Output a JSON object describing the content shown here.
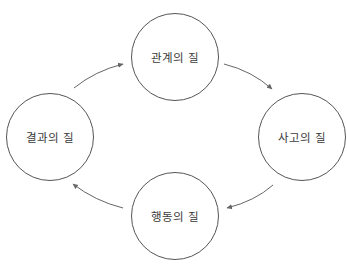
{
  "diagram": {
    "type": "cycle",
    "direction": "clockwise",
    "colors": {
      "stroke": "#555555",
      "arrow": "#666666",
      "text": "#3a3a3a",
      "background": "#ffffff"
    },
    "nodes": [
      {
        "id": "top",
        "label": "관계의 질",
        "cx": 175,
        "cy": 57,
        "r": 44
      },
      {
        "id": "right",
        "label": "사고의 질",
        "cx": 302,
        "cy": 137,
        "r": 44
      },
      {
        "id": "bottom",
        "label": "행동의 질",
        "cx": 175,
        "cy": 216,
        "r": 44
      },
      {
        "id": "left",
        "label": "결과의 질",
        "cx": 50,
        "cy": 137,
        "r": 44
      }
    ],
    "edges": [
      {
        "from": "left",
        "to": "top"
      },
      {
        "from": "top",
        "to": "right"
      },
      {
        "from": "right",
        "to": "bottom"
      },
      {
        "from": "bottom",
        "to": "left"
      }
    ]
  }
}
